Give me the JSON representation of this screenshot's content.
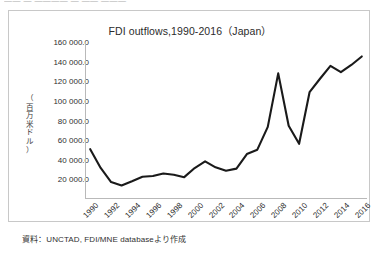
{
  "top_strip": {
    "cut_text": "—— — ———— — —— ———"
  },
  "figure": {
    "source_note": "資料：UNCTAD, FDI/MNE databaseより作成"
  },
  "chart_data": {
    "type": "line",
    "title": "FDI outflows,1990-2016（Japan）",
    "xlabel": "",
    "ylabel": "（百万米ドル）",
    "ylabel_chars": [
      "（",
      "百",
      "万",
      "米",
      "ド",
      "ル",
      "）"
    ],
    "ylim": [
      0,
      160000
    ],
    "ytick_values": [
      160000,
      140000,
      120000,
      100000,
      80000,
      60000,
      40000,
      20000
    ],
    "ytick_labels": [
      "160 000.0",
      "140 000.0",
      "120 000.0",
      "100 000.0",
      "80 000.0",
      "60 000.0",
      "40 000.0",
      "20 000.0"
    ],
    "xtick_labels": [
      "1990",
      "1992",
      "1994",
      "1996",
      "1998",
      "2000",
      "2002",
      "2004",
      "2006",
      "2008",
      "2010",
      "2012",
      "2014",
      "2016"
    ],
    "x": [
      1990,
      1991,
      1992,
      1993,
      1994,
      1995,
      1996,
      1997,
      1998,
      1999,
      2000,
      2001,
      2002,
      2003,
      2004,
      2005,
      2006,
      2007,
      2008,
      2009,
      2010,
      2011,
      2012,
      2013,
      2014,
      2015,
      2016
    ],
    "series": [
      {
        "name": "FDI outflows (Japan)",
        "color": "#1a1a1a",
        "values": [
          50775,
          31620,
          17240,
          13830,
          18090,
          22630,
          23440,
          26060,
          24630,
          22270,
          31560,
          38330,
          32280,
          28800,
          30960,
          45780,
          50270,
          73550,
          128020,
          74700,
          56260,
          108810,
          122550,
          135750,
          129220,
          136600,
          145240
        ]
      }
    ],
    "grid": false,
    "legend": "none",
    "annotations": []
  }
}
